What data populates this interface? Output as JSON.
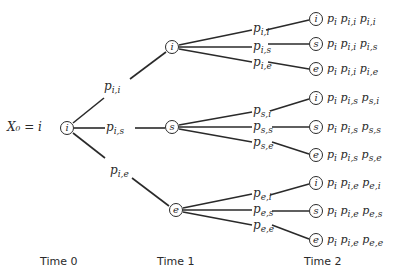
{
  "root": {
    "label": "X₀ = i",
    "state": "i"
  },
  "time_labels": [
    "Time 0",
    "Time 1",
    "Time 2"
  ],
  "level1": [
    {
      "state": "i",
      "edge_label": "p",
      "edge_sub": "i,i"
    },
    {
      "state": "s",
      "edge_label": "p",
      "edge_sub": "i,s"
    },
    {
      "state": "e",
      "edge_label": "p",
      "edge_sub": "i,e"
    }
  ],
  "level2": [
    {
      "state": "i",
      "edge_label": "p",
      "edge_sub": "i,i",
      "prob": "pᵢ pᵢ,ᵢ pᵢ,ᵢ",
      "prob_text": "pi pi,i pi,i"
    },
    {
      "state": "s",
      "edge_label": "p",
      "edge_sub": "i,s",
      "prob_text": "pi pi,i pi,s"
    },
    {
      "state": "e",
      "edge_label": "p",
      "edge_sub": "i,e",
      "prob_text": "pi pi,i pi,e"
    },
    {
      "state": "i",
      "edge_label": "p",
      "edge_sub": "s,i",
      "prob_text": "pi pi,s ps,i"
    },
    {
      "state": "s",
      "edge_label": "p",
      "edge_sub": "s,s",
      "prob_text": "pi pi,s ps,s"
    },
    {
      "state": "e",
      "edge_label": "p",
      "edge_sub": "s,e",
      "prob_text": "pi pi,s ps,e"
    },
    {
      "state": "i",
      "edge_label": "p",
      "edge_sub": "e,i",
      "prob_text": "pi pi,e pe,i"
    },
    {
      "state": "s",
      "edge_label": "p",
      "edge_sub": "e,s",
      "prob_text": "pi pi,e pe,s"
    },
    {
      "state": "e",
      "edge_label": "p",
      "edge_sub": "e,e",
      "prob_text": "pi pi,e pe,e"
    }
  ],
  "leaf_terms": [
    [
      [
        "p",
        "i"
      ],
      [
        "p",
        "i,i"
      ],
      [
        "p",
        "i,i"
      ]
    ],
    [
      [
        "p",
        "i"
      ],
      [
        "p",
        "i,i"
      ],
      [
        "p",
        "i,s"
      ]
    ],
    [
      [
        "p",
        "i"
      ],
      [
        "p",
        "i,i"
      ],
      [
        "p",
        "i,e"
      ]
    ],
    [
      [
        "p",
        "i"
      ],
      [
        "p",
        "i,s"
      ],
      [
        "p",
        "s,i"
      ]
    ],
    [
      [
        "p",
        "i"
      ],
      [
        "p",
        "i,s"
      ],
      [
        "p",
        "s,s"
      ]
    ],
    [
      [
        "p",
        "i"
      ],
      [
        "p",
        "i,s"
      ],
      [
        "p",
        "s,e"
      ]
    ],
    [
      [
        "p",
        "i"
      ],
      [
        "p",
        "i,e"
      ],
      [
        "p",
        "e,i"
      ]
    ],
    [
      [
        "p",
        "i"
      ],
      [
        "p",
        "i,e"
      ],
      [
        "p",
        "e,s"
      ]
    ],
    [
      [
        "p",
        "i"
      ],
      [
        "p",
        "i,e"
      ],
      [
        "p",
        "e,e"
      ]
    ]
  ]
}
